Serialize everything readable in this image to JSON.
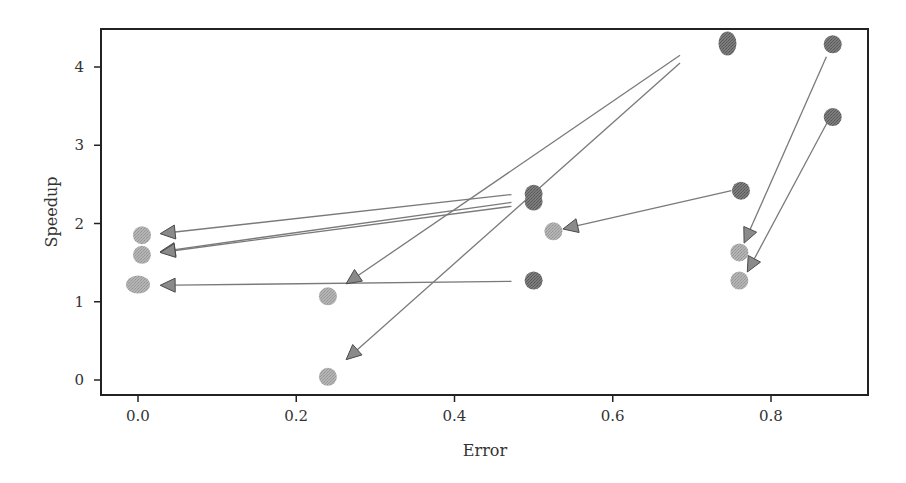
{
  "chart_data": {
    "type": "scatter",
    "title": "",
    "xlabel": "Error",
    "ylabel": "Speedup",
    "xlim": [
      -0.045,
      0.925
    ],
    "ylim": [
      -0.19,
      4.5
    ],
    "xticks": [
      0.0,
      0.2,
      0.4,
      0.6,
      0.8
    ],
    "xtick_labels": [
      "0.0",
      "0.2",
      "0.4",
      "0.6",
      "0.8"
    ],
    "yticks": [
      0,
      1,
      2,
      3,
      4
    ],
    "ytick_labels": [
      "0",
      "1",
      "2",
      "3",
      "4"
    ],
    "grid": false,
    "legend": null,
    "colors": {
      "dark_marker": "#6e6e6e",
      "light_marker": "#a9a9a9",
      "arrow": "#7a7a7a",
      "arrow_head": "#8a8a8a",
      "axis": "#222222"
    },
    "series": [
      {
        "name": "original",
        "marker": "dark-circle",
        "points": [
          {
            "x": 0.745,
            "y": 4.3,
            "elongated": true
          },
          {
            "x": 0.878,
            "y": 4.29
          },
          {
            "x": 0.878,
            "y": 3.36
          },
          {
            "x": 0.5,
            "y": 2.38
          },
          {
            "x": 0.5,
            "y": 2.28
          },
          {
            "x": 0.762,
            "y": 2.42
          },
          {
            "x": 0.5,
            "y": 1.27
          }
        ]
      },
      {
        "name": "modified",
        "marker": "light-circle",
        "points": [
          {
            "x": 0.005,
            "y": 1.85
          },
          {
            "x": 0.005,
            "y": 1.6
          },
          {
            "x": 0.0,
            "y": 1.22,
            "wide": true
          },
          {
            "x": 0.24,
            "y": 1.07
          },
          {
            "x": 0.24,
            "y": 0.04
          },
          {
            "x": 0.525,
            "y": 1.9
          },
          {
            "x": 0.76,
            "y": 1.63
          },
          {
            "x": 0.76,
            "y": 1.27
          }
        ]
      }
    ],
    "arrows": [
      {
        "from": {
          "x": 0.472,
          "y": 2.37
        },
        "to": {
          "x": 0.028,
          "y": 1.87
        }
      },
      {
        "from": {
          "x": 0.472,
          "y": 2.27
        },
        "to": {
          "x": 0.028,
          "y": 1.64
        }
      },
      {
        "from": {
          "x": 0.472,
          "y": 2.22
        },
        "to": {
          "x": 0.028,
          "y": 1.63
        }
      },
      {
        "from": {
          "x": 0.472,
          "y": 1.26
        },
        "to": {
          "x": 0.028,
          "y": 1.21
        }
      },
      {
        "from": {
          "x": 0.685,
          "y": 4.15
        },
        "to": {
          "x": 0.263,
          "y": 1.23
        }
      },
      {
        "from": {
          "x": 0.685,
          "y": 4.05
        },
        "to": {
          "x": 0.263,
          "y": 0.26
        }
      },
      {
        "from": {
          "x": 0.75,
          "y": 2.42
        },
        "to": {
          "x": 0.537,
          "y": 1.93
        }
      },
      {
        "from": {
          "x": 0.87,
          "y": 4.13
        },
        "to": {
          "x": 0.766,
          "y": 1.75
        }
      },
      {
        "from": {
          "x": 0.871,
          "y": 3.29
        },
        "to": {
          "x": 0.77,
          "y": 1.38
        }
      }
    ]
  }
}
